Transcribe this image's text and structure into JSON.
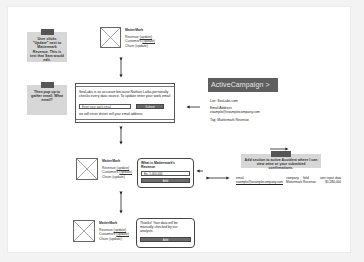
{
  "notes": [
    {
      "text": "User clicks \"Update\" next to Mattermark Revenue. This is text that Sam would edit."
    },
    {
      "text": "Then pop up to gather email. What email?"
    },
    {
      "text": "Add section to active Accident where I can view mine or your submitted confirmations."
    }
  ],
  "widgets": [
    {
      "company": "MatterMark",
      "rows": [
        {
          "label": "Revenue",
          "link": "(update)"
        },
        {
          "label": "Customers",
          "link": "(update)"
        },
        {
          "label": "Churn",
          "link": "(update)"
        }
      ]
    },
    {
      "company": "MatterMark",
      "rows": [
        {
          "label": "Revenue",
          "link": "(update)"
        },
        {
          "label": "Customers",
          "link": "(update)"
        },
        {
          "label": "Churn",
          "link": "(update)"
        }
      ]
    },
    {
      "company": "MatterMark",
      "rows": [
        {
          "label": "Revenue",
          "link": "(update)"
        },
        {
          "label": "Customers",
          "link": "(update)"
        },
        {
          "label": "Churn",
          "link": "(update)"
        }
      ]
    }
  ],
  "popup": {
    "text": "SeoLabs is so accurate because Nathan Latka personally checks every data source. To update enter your work email",
    "email_placeholder": "Enter your work email",
    "submit_label": "Submit",
    "fine_print": "we will never distort sell your email address"
  },
  "bubble_question": {
    "question": "What is Mattermark's Revenue",
    "value": "Ex. 1,000,000",
    "button": "Add"
  },
  "bubble_thanks": {
    "text": "Thanks! Your data will be manually checked by our analysts.",
    "button": "Add"
  },
  "activecampaign": {
    "logo": "ActiveCampaign >",
    "list": "List: SeoLabs.com",
    "email_label": "Email Address",
    "email_value": "example@examplecompany.com",
    "tag": "Tag: Mattermark Revenue"
  },
  "record": {
    "headers": [
      "email",
      "company",
      "field",
      "user input data"
    ],
    "values": [
      "example@examplecompany.com",
      "Mattermark",
      "Revenue",
      "$1,284,000"
    ]
  },
  "colors": {
    "note_bg": "#d7d7d7",
    "tape": "#555555",
    "ac_bg": "#5f5f5f",
    "button_bg": "#6b6b6b"
  }
}
